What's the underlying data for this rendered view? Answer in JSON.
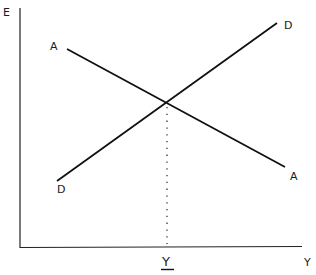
{
  "diagram": {
    "type": "economics-equilibrium",
    "axes": {
      "y_label": "E",
      "x_label": "Y"
    },
    "lines": [
      {
        "id": "A",
        "start_label": "A",
        "end_label": "A",
        "slope": "negative"
      },
      {
        "id": "D",
        "start_label": "D",
        "end_label": "D",
        "slope": "positive"
      }
    ],
    "equilibrium": {
      "label": "Y",
      "underlined": true,
      "guide": "dotted vertical line from intersection to horizontal axis"
    },
    "colors": {
      "line": "#111111",
      "background": "#ffffff"
    }
  }
}
